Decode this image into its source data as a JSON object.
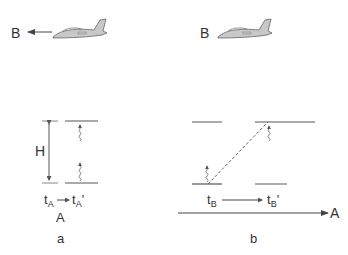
{
  "panel_a": {
    "label": "a",
    "observer_label": "B",
    "frame_label": "A",
    "height_label": "H",
    "time_start": {
      "base": "t",
      "sub": "A",
      "prime": ""
    },
    "time_end": {
      "base": "t",
      "sub": "A",
      "prime": "'"
    },
    "plane_direction": "left"
  },
  "panel_b": {
    "label": "b",
    "observer_label": "B",
    "motion_label": "A",
    "time_start": {
      "base": "t",
      "sub": "B",
      "prime": ""
    },
    "time_end": {
      "base": "t",
      "sub": "B",
      "prime": "'"
    }
  },
  "colors": {
    "line": "#555555",
    "plane_fill": "#c8c8c8",
    "text": "#333333"
  }
}
